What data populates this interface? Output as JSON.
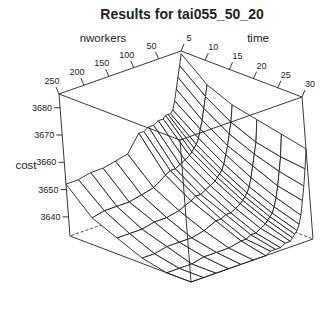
{
  "chart_data": {
    "type": "surface3d",
    "title": "Results for tai055_50_20",
    "xlabel": "nworkers",
    "ylabel": "time",
    "zlabel": "cost",
    "x_ticks": [
      50,
      100,
      150,
      200,
      250
    ],
    "y_ticks": [
      5,
      10,
      15,
      20,
      25,
      30
    ],
    "z_ticks": [
      3640,
      3650,
      3660,
      3670,
      3680
    ],
    "xlim": [
      5,
      250
    ],
    "ylim": [
      5,
      30
    ],
    "zlim": [
      3633,
      3685
    ],
    "x": [
      5,
      10,
      15,
      20,
      25,
      30,
      35,
      40,
      45,
      50,
      60,
      70,
      80,
      90,
      100,
      125,
      150,
      175,
      200,
      225,
      250
    ],
    "y": [
      5,
      10,
      15,
      20,
      25,
      30
    ],
    "z": [
      [
        3684,
        3676,
        3672,
        3670,
        3668,
        3666
      ],
      [
        3680,
        3672,
        3666,
        3662,
        3660,
        3659
      ],
      [
        3676,
        3668,
        3662,
        3658,
        3655,
        3653
      ],
      [
        3672,
        3664,
        3658,
        3654,
        3650,
        3648
      ],
      [
        3668,
        3661,
        3655,
        3650,
        3646,
        3643
      ],
      [
        3665,
        3658,
        3652,
        3647,
        3643,
        3640
      ],
      [
        3664,
        3656,
        3650,
        3645,
        3641,
        3638
      ],
      [
        3664,
        3655,
        3649,
        3644,
        3640,
        3637
      ],
      [
        3664,
        3654,
        3648,
        3643,
        3639,
        3636
      ],
      [
        3663,
        3653,
        3647,
        3642,
        3638,
        3635
      ],
      [
        3663,
        3652,
        3646,
        3641,
        3637,
        3635
      ],
      [
        3662,
        3651,
        3645,
        3640,
        3636,
        3634
      ],
      [
        3662,
        3650,
        3644,
        3640,
        3636,
        3634
      ],
      [
        3661,
        3650,
        3644,
        3639,
        3635,
        3634
      ],
      [
        3661,
        3649,
        3643,
        3639,
        3635,
        3633
      ],
      [
        3655,
        3646,
        3641,
        3637,
        3634,
        3633
      ],
      [
        3654,
        3645,
        3640,
        3636,
        3634,
        3633
      ],
      [
        3653,
        3644,
        3640,
        3636,
        3634,
        3633
      ],
      [
        3653,
        3644,
        3639,
        3636,
        3633,
        3633
      ],
      [
        3652,
        3644,
        3639,
        3635,
        3633,
        3633
      ],
      [
        3652,
        3643,
        3639,
        3635,
        3633,
        3633
      ]
    ],
    "grid": false,
    "box": true
  }
}
